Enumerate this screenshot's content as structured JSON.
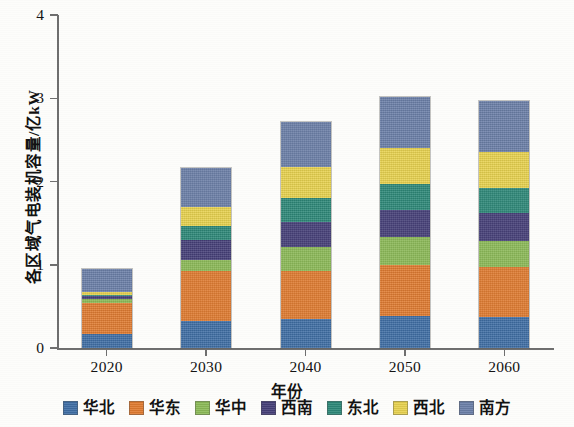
{
  "chart_data": {
    "type": "bar",
    "stacked": true,
    "title": "",
    "xlabel": "年份",
    "ylabel": "各区域气电装机容量/亿kW",
    "categories": [
      "2020",
      "2030",
      "2040",
      "2050",
      "2060"
    ],
    "ylim": [
      0,
      4
    ],
    "yticks": [
      "0",
      "1",
      "2",
      "3",
      "4"
    ],
    "ytick_values": [
      0,
      1,
      2,
      3,
      4
    ],
    "grid": false,
    "legend_position": "bottom",
    "series": [
      {
        "name": "华北",
        "color": "#3f6ea5",
        "values": [
          0.17,
          0.33,
          0.35,
          0.38,
          0.37
        ]
      },
      {
        "name": "华东",
        "color": "#e07b30",
        "values": [
          0.37,
          0.6,
          0.58,
          0.62,
          0.6
        ]
      },
      {
        "name": "华中",
        "color": "#8cba57",
        "values": [
          0.05,
          0.13,
          0.28,
          0.33,
          0.32
        ]
      },
      {
        "name": "西南",
        "color": "#453f78",
        "values": [
          0.03,
          0.24,
          0.31,
          0.33,
          0.33
        ]
      },
      {
        "name": "东北",
        "color": "#2d8878",
        "values": [
          0.02,
          0.17,
          0.28,
          0.31,
          0.3
        ]
      },
      {
        "name": "西北",
        "color": "#e8d24f",
        "values": [
          0.03,
          0.22,
          0.37,
          0.43,
          0.43
        ]
      },
      {
        "name": "南方",
        "color": "#6b7fa8",
        "values": [
          0.28,
          0.47,
          0.55,
          0.61,
          0.62
        ]
      }
    ],
    "totals": [
      0.95,
      2.16,
      2.72,
      3.01,
      2.97
    ]
  },
  "legend": {
    "items": [
      {
        "label": "华北"
      },
      {
        "label": "华东"
      },
      {
        "label": "华中"
      },
      {
        "label": "西南"
      },
      {
        "label": "东北"
      },
      {
        "label": "西北"
      },
      {
        "label": "南方"
      }
    ]
  }
}
